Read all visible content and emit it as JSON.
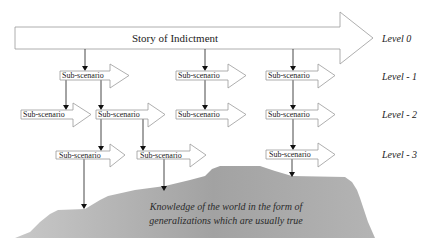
{
  "main_story": {
    "label": "Story of Indictment"
  },
  "levels": [
    {
      "label": "Level 0"
    },
    {
      "label": "Level - 1"
    },
    {
      "label": "Level - 2"
    },
    {
      "label": "Level - 3"
    }
  ],
  "sub_scenario_label": "Sub-scenario",
  "scenarios": {
    "l1": [
      {
        "label": "Sub-scenario"
      },
      {
        "label": "Sub-scenario"
      },
      {
        "label": "Sub-scenario"
      }
    ],
    "l2": [
      {
        "label": "Sub-scenario"
      },
      {
        "label": "Sub-scenario"
      },
      {
        "label": "Sub-scenario"
      },
      {
        "label": "Sub-scenario"
      }
    ],
    "l3": [
      {
        "label": "Sub-scenario"
      },
      {
        "label": "Sub-scenario"
      },
      {
        "label": "Sub-scenario"
      }
    ]
  },
  "knowledge_base": {
    "line1": "Knowledge of the world in the form of",
    "line2": "generalizations which are usually true"
  },
  "colors": {
    "arrow_stroke": "#9a9a9a",
    "connector": "#333333",
    "mountain_light": "#c4c4c4",
    "mountain_dark": "#9c9c9c"
  }
}
